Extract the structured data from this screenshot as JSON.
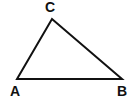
{
  "figure": {
    "kind": "geometry-diagram",
    "shape_name": "triangle",
    "background_color": "#ffffff",
    "stroke_color": "#111111",
    "stroke_width_px": 2,
    "label_color": "#111111",
    "canvas": {
      "width": 135,
      "height": 101
    }
  },
  "labels": {
    "a": "A",
    "b": "B",
    "c": "C"
  },
  "chart_data": {
    "type": "scatter",
    "title": "",
    "xlabel": "",
    "ylabel": "",
    "xlim": [
      0,
      135
    ],
    "ylim": [
      0,
      101
    ],
    "grid": false,
    "legend": "none",
    "annotations": [
      "A",
      "B",
      "C"
    ],
    "vertices": [
      {
        "label": "A",
        "x": 17,
        "y": 79
      },
      {
        "label": "B",
        "x": 122,
        "y": 79
      },
      {
        "label": "C",
        "x": 52,
        "y": 19
      }
    ],
    "edges": [
      {
        "from": "A",
        "to": "B"
      },
      {
        "from": "B",
        "to": "C"
      },
      {
        "from": "C",
        "to": "A"
      }
    ],
    "polygon_points": "17,79 52,19 122,79"
  }
}
